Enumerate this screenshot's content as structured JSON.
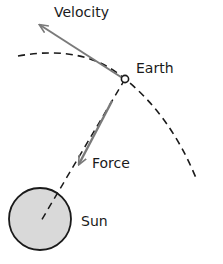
{
  "diagram": {
    "labels": {
      "velocity": "Velocity",
      "earth": "Earth",
      "force": "Force",
      "sun": "Sun"
    },
    "colors": {
      "line": "#1a1a1a",
      "arrow": "#7a7a7a",
      "sun_fill": "#d9d9d9",
      "background": "#ffffff"
    }
  }
}
